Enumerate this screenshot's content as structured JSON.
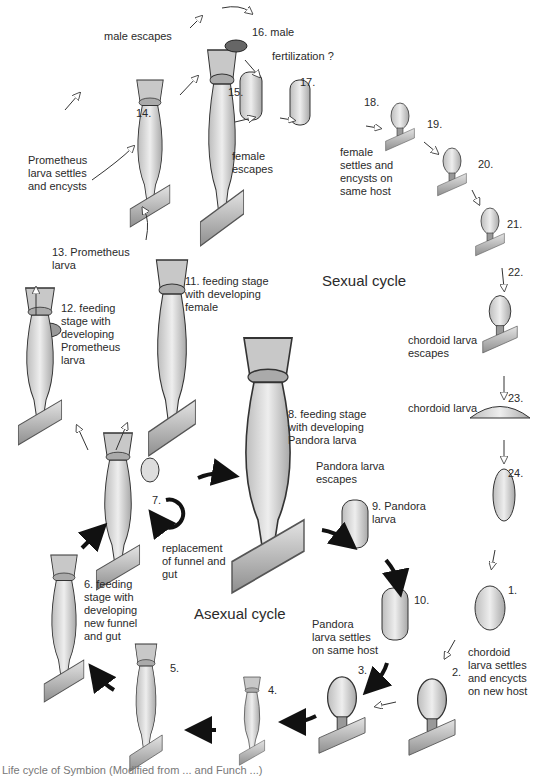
{
  "figure": {
    "cycles": {
      "sexual": "Sexual cycle",
      "asexual": "Asexual cycle"
    },
    "labels": {
      "male_escapes": "male escapes",
      "s16": "16. male",
      "fertilization": "fertilization ?",
      "s15": "15.",
      "s17": "17.",
      "s18": "18.",
      "s19": "19.",
      "s20": "20.",
      "s21": "21.",
      "s22": "22.",
      "s23": "23.",
      "s24": "24.",
      "s14": "14.",
      "female_escapes": "female\nescapes",
      "female_settles": "female\nsettles and\nencysts on\nsame host",
      "prometheus_settles": "Prometheus\nlarva settles\nand encysts",
      "s13": "13. Prometheus\n      larva",
      "s12": "12. feeding\n      stage with\n      developing\n      Prometheus\n      larva",
      "s11": "11. feeding stage\n      with developing\n      female",
      "chordoid_escapes": "chordoid larva\nescapes",
      "chordoid_larva": "chordoid larva",
      "s8": "8. feeding stage\n    with developing\n    Pandora larva",
      "pandora_escapes": "Pandora larva\n escapes",
      "s9": "9. Pandora\n    larva",
      "s7": "7.",
      "replacement": "replacement\nof funnel and\ngut",
      "s6": "6. feeding\n    stage with\n    developing\n    new funnel\n    and gut",
      "s10": "10.",
      "s1": "1.",
      "pandora_settles": "Pandora\nlarva settles\non same host",
      "s2": "2.",
      "chordoid_settles": "chordoid\nlarva settles\nand encycts\non new host",
      "s3": "3.",
      "s4": "4.",
      "s5": "5."
    },
    "caption": "Life cycle of Symbion (Modified from ... and Funch ...)",
    "colors": {
      "ink": "#2a2a2a",
      "organism_fill": "#d9d9d9",
      "substrate": "#bdbdbd",
      "sexual_arrow": "#ffffff",
      "asexual_arrow": "#111111"
    }
  }
}
